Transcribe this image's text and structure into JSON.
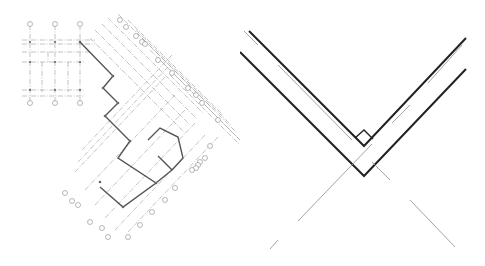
{
  "figure": {
    "panels": [
      {
        "id": "floor-plan",
        "label": ""
      },
      {
        "id": "corner-detail",
        "label": ""
      }
    ]
  },
  "colors": {
    "grid_line": "#9a9a9a",
    "wall_line": "#555555",
    "detail_wall": "#222222",
    "detail_thin": "#999999"
  }
}
